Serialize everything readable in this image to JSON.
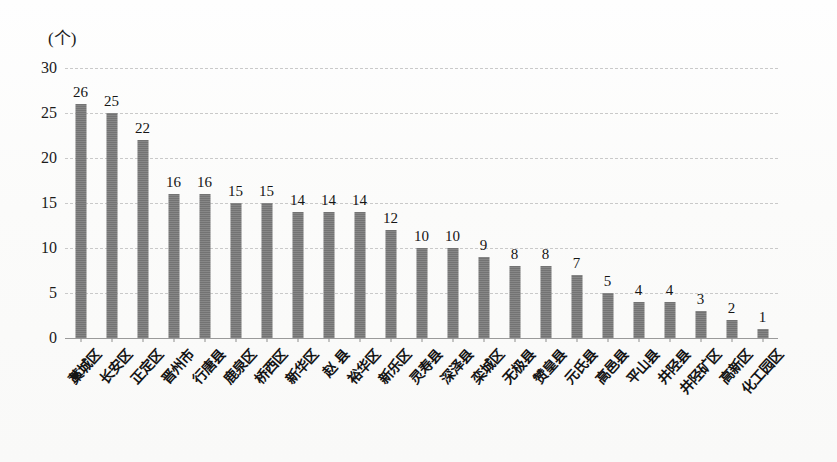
{
  "chart_data": {
    "type": "bar",
    "title": "",
    "subtitle": "",
    "xlabel": "",
    "ylabel": "",
    "unit_label": "(个)",
    "ylim": [
      0,
      30
    ],
    "yticks": [
      0,
      5,
      10,
      15,
      20,
      25,
      30
    ],
    "ytick_labels": [
      "0",
      "5",
      "10",
      "15",
      "20",
      "25",
      "30"
    ],
    "grid": true,
    "grid_orientation": "horizontal",
    "legend": false,
    "legend_position": "none",
    "bar_color": "#797979",
    "categories": [
      "藁城区",
      "长安区",
      "正定区",
      "晋州市",
      "行唐县",
      "鹿泉区",
      "桥西区",
      "新华区",
      "赵  县",
      "裕华区",
      "新乐区",
      "灵寿县",
      "深泽县",
      "栾城区",
      "无极县",
      "赞皇县",
      "元氏县",
      "高邑县",
      "平山县",
      "井陉县",
      "井陉矿区",
      "高新区",
      "化工园区"
    ],
    "values": [
      26,
      25,
      22,
      16,
      16,
      15,
      15,
      14,
      14,
      14,
      12,
      10,
      10,
      9,
      8,
      8,
      7,
      5,
      4,
      4,
      3,
      2,
      1
    ],
    "data_labels": [
      "26",
      "25",
      "22",
      "16",
      "16",
      "15",
      "15",
      "14",
      "14",
      "14",
      "12",
      "10",
      "10",
      "9",
      "8",
      "8",
      "7",
      "5",
      "4",
      "4",
      "3",
      "2",
      "1"
    ]
  }
}
